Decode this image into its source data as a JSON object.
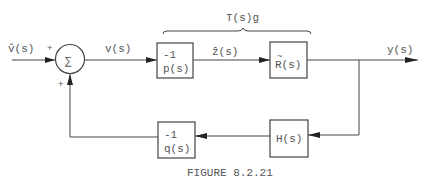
{
  "diagram": {
    "input_label": "v̂(s)",
    "input_sign": "+",
    "feedback_sign": "+",
    "summer_symbol": "∑",
    "v_label": "v(s)",
    "block_p": {
      "line1": "-1",
      "line2": "p(s)"
    },
    "z_label": "ẑ(s)",
    "block_r": {
      "tilde": "~",
      "line1": "R(s)"
    },
    "output_label": "y(s)",
    "brace_label": "T(s)g",
    "block_h": {
      "line1": "H(s)"
    },
    "block_q": {
      "line1": "-1",
      "line2": "q(s)"
    },
    "caption": "FIGURE 8.2.21"
  }
}
